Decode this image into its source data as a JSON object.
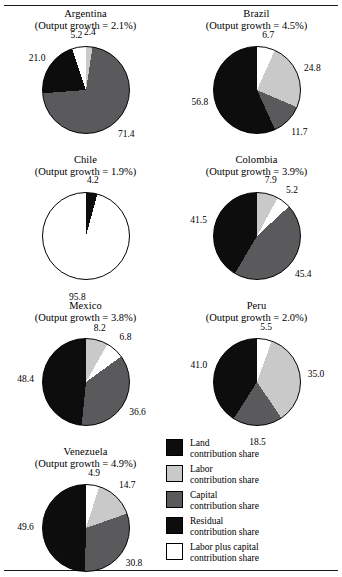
{
  "figure": {
    "legend": [
      {
        "key": "land",
        "label_line1": "Land",
        "label_line2": "contribution share",
        "color": "#0d0d0d"
      },
      {
        "key": "labor",
        "label_line1": "Labor",
        "label_line2": "contribution share",
        "color": "#c9c9c9"
      },
      {
        "key": "capital",
        "label_line1": "Capital",
        "label_line2": "contribution share",
        "color": "#5a5a5c"
      },
      {
        "key": "residual",
        "label_line1": "Residual",
        "label_line2": "contribution share",
        "color": "#0d0d0d"
      },
      {
        "key": "labor_plus_capital",
        "label_line1": "Labor plus capital",
        "label_line2": "contribution share",
        "color": "#ffffff"
      }
    ]
  },
  "chart_data": [
    {
      "type": "pie",
      "title": "Argentina",
      "subtitle": "(Output growth = 2.1%)",
      "output_growth": 2.1,
      "labels": [
        "2.4",
        "71.4",
        "21.0",
        "5.2"
      ],
      "values": [
        2.4,
        71.4,
        21.0,
        5.2
      ],
      "categories": [
        "Labor contribution share",
        "Capital contribution share",
        "Land contribution share",
        "Labor plus capital contribution share"
      ],
      "colors": [
        "#c9c9c9",
        "#5a5a5c",
        "#0d0d0d",
        "#ffffff"
      ]
    },
    {
      "type": "pie",
      "title": "Brazil",
      "subtitle": "(Output growth = 4.5%)",
      "output_growth": 4.5,
      "labels": [
        "6.7",
        "24.8",
        "11.7",
        "56.8"
      ],
      "values": [
        6.7,
        24.8,
        11.7,
        56.8
      ],
      "categories": [
        "Labor plus capital contribution share",
        "Labor contribution share",
        "Capital contribution share",
        "Land contribution share"
      ],
      "colors": [
        "#ffffff",
        "#c9c9c9",
        "#5a5a5c",
        "#0d0d0d"
      ]
    },
    {
      "type": "pie",
      "title": "Chile",
      "subtitle": "(Output growth = 1.9%)",
      "output_growth": 1.9,
      "labels": [
        "4.2",
        "95.8"
      ],
      "values": [
        4.2,
        95.8
      ],
      "categories": [
        "Residual contribution share",
        "Labor plus capital contribution share"
      ],
      "colors": [
        "#0d0d0d",
        "#ffffff"
      ]
    },
    {
      "type": "pie",
      "title": "Colombia",
      "subtitle": "(Output growth = 3.9%)",
      "output_growth": 3.9,
      "labels": [
        "7.9",
        "5.2",
        "45.4",
        "41.5"
      ],
      "values": [
        7.9,
        5.2,
        45.4,
        41.5
      ],
      "categories": [
        "Labor contribution share",
        "Labor plus capital contribution share",
        "Capital contribution share",
        "Land contribution share"
      ],
      "colors": [
        "#c9c9c9",
        "#ffffff",
        "#5a5a5c",
        "#0d0d0d"
      ]
    },
    {
      "type": "pie",
      "title": "Mexico",
      "subtitle": "(Output growth = 3.8%)",
      "output_growth": 3.8,
      "labels": [
        "8.2",
        "6.8",
        "36.6",
        "48.4"
      ],
      "values": [
        8.2,
        6.8,
        36.6,
        48.4
      ],
      "categories": [
        "Labor contribution share",
        "Labor plus capital contribution share",
        "Capital contribution share",
        "Land contribution share"
      ],
      "colors": [
        "#c9c9c9",
        "#ffffff",
        "#5a5a5c",
        "#0d0d0d"
      ]
    },
    {
      "type": "pie",
      "title": "Peru",
      "subtitle": "(Output growth = 2.0%)",
      "output_growth": 2.0,
      "labels": [
        "5.5",
        "35.0",
        "18.5",
        "41.0"
      ],
      "values": [
        5.5,
        35.0,
        18.5,
        41.0
      ],
      "categories": [
        "Labor plus capital contribution share",
        "Labor contribution share",
        "Capital contribution share",
        "Land contribution share"
      ],
      "colors": [
        "#ffffff",
        "#c9c9c9",
        "#5a5a5c",
        "#0d0d0d"
      ]
    },
    {
      "type": "pie",
      "title": "Venezuela",
      "subtitle": "(Output growth = 4.9%)",
      "output_growth": 4.9,
      "labels": [
        "4.9",
        "14.7",
        "30.8",
        "49.6"
      ],
      "values": [
        4.9,
        14.7,
        30.8,
        49.6
      ],
      "categories": [
        "Labor plus capital contribution share",
        "Labor contribution share",
        "Capital contribution share",
        "Land contribution share"
      ],
      "colors": [
        "#ffffff",
        "#c9c9c9",
        "#5a5a5c",
        "#0d0d0d"
      ]
    }
  ]
}
